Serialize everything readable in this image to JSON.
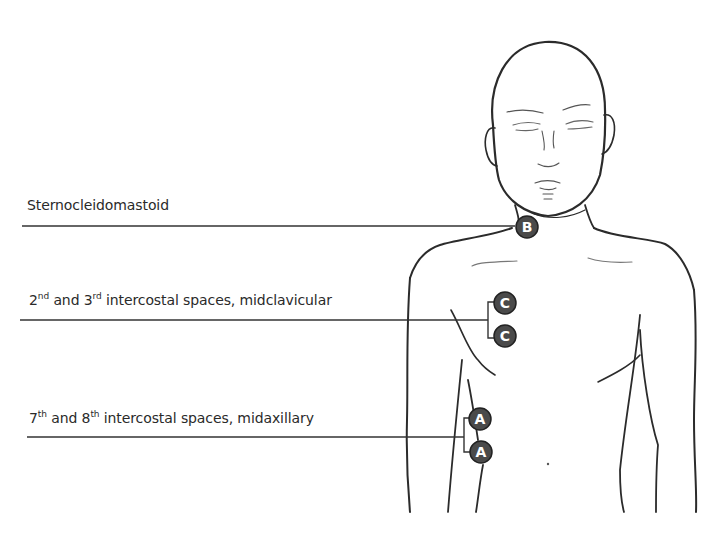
{
  "diagram": {
    "type": "anatomical-label-diagram",
    "labels": [
      {
        "id": "sternocleidomastoid",
        "text": "Sternocleidomastoid",
        "marker": "B",
        "marker_count": 1
      },
      {
        "id": "intercostal-2-3",
        "text_parts": [
          {
            "text": "2"
          },
          {
            "sup": "nd"
          },
          {
            "text": " and 3"
          },
          {
            "sup": "rd"
          },
          {
            "text": " intercostal spaces, midclavicular"
          }
        ],
        "marker": "C",
        "marker_count": 2
      },
      {
        "id": "intercostal-7-8",
        "text_parts": [
          {
            "text": "7"
          },
          {
            "sup": "th"
          },
          {
            "text": " and 8"
          },
          {
            "sup": "th"
          },
          {
            "text": " intercostal spaces, midaxillary"
          }
        ],
        "marker": "A",
        "marker_count": 2
      }
    ],
    "markers": {
      "B": "B",
      "C1": "C",
      "C2": "C",
      "A1": "A",
      "A2": "A"
    },
    "colors": {
      "background": "#ffffff",
      "line": "#333333",
      "sketch": "#2b2b2b",
      "marker_fill": "#4a4a4a",
      "marker_text": "#ffffff"
    }
  }
}
